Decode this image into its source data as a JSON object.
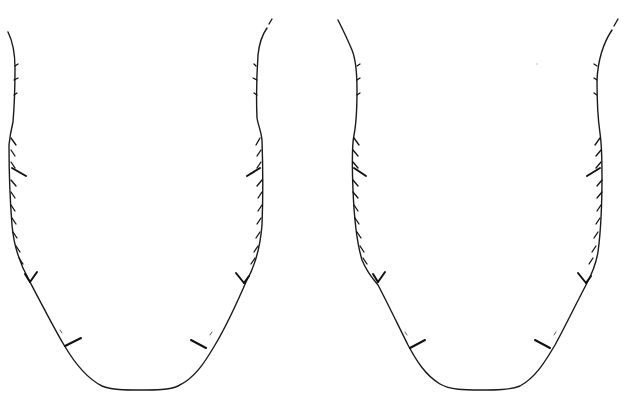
{
  "illustration": {
    "background": "#ffffff",
    "stroke_color": "#1a1a1a",
    "figures": [
      {
        "id": "left",
        "description": "U-shaped outline with serrated setae along sides",
        "offset_x": 0
      },
      {
        "id": "right",
        "description": "U-shaped outline with serrated setae along sides",
        "offset_x": 330
      }
    ]
  }
}
